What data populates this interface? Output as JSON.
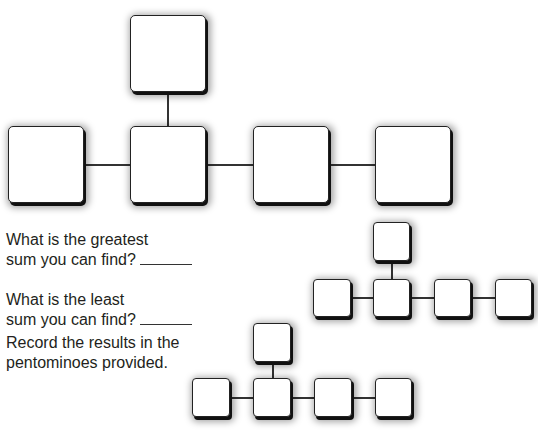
{
  "questions": {
    "greatest_line1": "What is the greatest",
    "greatest_line2": "sum you can find?",
    "least_line1": "What is the least",
    "least_line2": "sum you can find?",
    "record_line1": "Record the results in the",
    "record_line2": "pentominoes provided."
  },
  "large_pentomino": {
    "cells": [
      "top",
      "row-1",
      "row-2",
      "row-3",
      "row-4"
    ]
  },
  "answer_pentominoes": [
    {
      "label": "greatest-sum-pentomino"
    },
    {
      "label": "least-sum-pentomino"
    }
  ]
}
